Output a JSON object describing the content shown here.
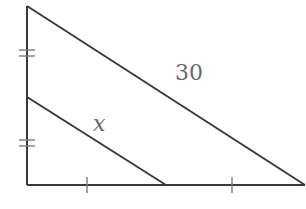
{
  "diagram": {
    "type": "geometry-similar-triangles",
    "stroke_color": "#3a3a3a",
    "tick_color": "#7a7a7a",
    "label_color": "#6a6a6a",
    "outer_triangle": {
      "vertices": {
        "top": [
          27,
          6
        ],
        "right_angle": [
          27,
          185
        ],
        "bottom_right": [
          305,
          185
        ]
      },
      "hypotenuse_label": "30"
    },
    "inner_segment": {
      "from": [
        27,
        97
      ],
      "to": [
        166,
        185
      ],
      "label": "x"
    },
    "tick_marks": {
      "left_side_double": [
        {
          "y1": 50,
          "y2": 56
        },
        {
          "y1": 140,
          "y2": 146
        }
      ],
      "bottom_single": [
        {
          "x": 87
        },
        {
          "x": 232
        }
      ]
    },
    "labels": {
      "hypotenuse": {
        "text": "30",
        "x": 175,
        "y": 80
      },
      "inner": {
        "text": "x",
        "x": 100,
        "y": 125
      }
    }
  }
}
